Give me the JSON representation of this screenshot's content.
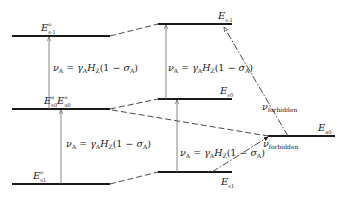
{
  "diagram": {
    "type": "energy-level diagram",
    "levels": {
      "left_top": {
        "label": "E",
        "superscript": "o",
        "subscript": "s-1"
      },
      "left_middle": {
        "label_1": "E",
        "sub_1": "s0",
        "label_2": "E",
        "sub_2": "a0",
        "superscript": "o"
      },
      "left_bottom": {
        "label": "E",
        "superscript": "o",
        "subscript": "s1"
      },
      "middle_top": {
        "label": "E",
        "subscript": "s-1"
      },
      "middle_middle": {
        "label": "E",
        "subscript": "s0"
      },
      "middle_bottom": {
        "label": "E",
        "subscript": "s1"
      },
      "right": {
        "label": "E",
        "subscript": "a0"
      }
    },
    "transitions": {
      "nu": "ν",
      "nu_sub": "A",
      "equals": " = ",
      "gamma": "γ",
      "gamma_sub": "A",
      "H": "H",
      "H_sub": "Z",
      "paren_open": "(1 − ",
      "sigma": "σ",
      "sigma_sub": "A",
      "paren_close": ")"
    },
    "forbidden": {
      "nu": "ν",
      "sub": "forbidden"
    },
    "colors": {
      "line": "#1a1a1a",
      "arrow": "#6a6a6a",
      "dashed": "#333333"
    }
  }
}
